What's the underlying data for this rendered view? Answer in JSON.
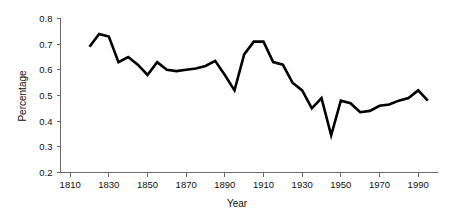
{
  "chart_data": {
    "type": "line",
    "title": "",
    "xlabel": "Year",
    "ylabel": "Percentage",
    "xlim": [
      1805,
      2000
    ],
    "ylim": [
      0.2,
      0.8
    ],
    "grid": false,
    "legend": null,
    "xticks": [
      1810,
      1830,
      1850,
      1870,
      1890,
      1910,
      1930,
      1950,
      1970,
      1990
    ],
    "xtick_labels": [
      "1810",
      "1830",
      "1850",
      "1870",
      "1890",
      "1910",
      "1930",
      "1950",
      "1970",
      "1990"
    ],
    "yticks": [
      0.2,
      0.3,
      0.4,
      0.5,
      0.6,
      0.7,
      0.8
    ],
    "ytick_labels": [
      "0.2",
      "0.3",
      "0.4",
      "0.5",
      "0.6",
      "0.7",
      "0.8"
    ],
    "line_color": "#000000",
    "series": [
      {
        "name": "Percentage",
        "x": [
          1820,
          1825,
          1830,
          1835,
          1840,
          1845,
          1850,
          1855,
          1860,
          1865,
          1870,
          1875,
          1880,
          1885,
          1890,
          1895,
          1900,
          1905,
          1910,
          1915,
          1920,
          1925,
          1930,
          1935,
          1940,
          1945,
          1950,
          1955,
          1960,
          1965,
          1970,
          1975,
          1980,
          1985,
          1990,
          1995
        ],
        "values": [
          0.69,
          0.74,
          0.73,
          0.63,
          0.65,
          0.62,
          0.58,
          0.63,
          0.6,
          0.595,
          0.6,
          0.605,
          0.615,
          0.635,
          0.58,
          0.52,
          0.66,
          0.71,
          0.71,
          0.63,
          0.62,
          0.55,
          0.52,
          0.45,
          0.49,
          0.345,
          0.48,
          0.47,
          0.435,
          0.44,
          0.46,
          0.465,
          0.48,
          0.49,
          0.52,
          0.48
        ]
      }
    ]
  },
  "axes": {
    "y_axis_title": "Percentage",
    "x_axis_title": "Year"
  }
}
